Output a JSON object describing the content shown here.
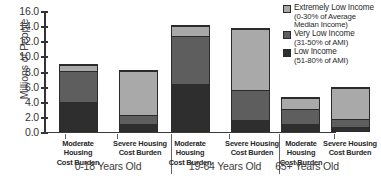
{
  "chart_data": {
    "type": "bar",
    "subtype": "stacked",
    "title": "",
    "xlabel": "",
    "ylabel": "Millions of People",
    "ylim": [
      0.0,
      16.0
    ],
    "ytick_labels": [
      "0.0",
      "2.0",
      "4.0",
      "6.0",
      "8.0",
      "10.0",
      "12.0",
      "14.0",
      "16.0"
    ],
    "ytick_values": [
      0.0,
      2.0,
      4.0,
      6.0,
      8.0,
      10.0,
      12.0,
      14.0,
      16.0
    ],
    "grid": false,
    "legend_position": "top-right",
    "categories": [
      "Moderate Housing Cost Burden",
      "Severe Housing Cost Burden",
      "Moderate Housing Cost Burden",
      "Severe Housing Cost Burden",
      "Moderate Housing Cost Burden",
      "Severe Housing Cost Burden"
    ],
    "groups": [
      {
        "label": "0-18 Years Old",
        "categories": [
          "Moderate Housing Cost Burden",
          "Severe Housing Cost Burden"
        ]
      },
      {
        "label": "19-64 Years Old",
        "categories": [
          "Moderate Housing Cost Burden",
          "Severe Housing Cost Burden"
        ]
      },
      {
        "label": "65+ Years Old",
        "categories": [
          "Moderate Housing Cost Burden",
          "Severe Housing Cost Burden"
        ]
      }
    ],
    "series": [
      {
        "name": "Low Income (51-80% of AMI)",
        "color": "#2e2e2e",
        "values": [
          4.0,
          1.0,
          6.3,
          1.5,
          1.0,
          0.6
        ]
      },
      {
        "name": "Very Low Income (31-50% of AMI)",
        "color": "#5e5e5e",
        "values": [
          4.2,
          1.2,
          6.5,
          4.0,
          2.1,
          1.0
        ]
      },
      {
        "name": "Extremely Low Income (0-30% of Average Median Income)",
        "color": "#a9a9a9",
        "values": [
          0.8,
          6.0,
          1.3,
          8.3,
          1.5,
          4.3
        ]
      }
    ],
    "totals": [
      9.0,
      8.2,
      14.1,
      13.8,
      4.6,
      5.9
    ]
  },
  "axis": {
    "y_title": "Millions of People"
  },
  "legend": {
    "items": [
      {
        "swatch": "extreme",
        "line1": "Extremely Low Income",
        "line2": "(0-30% of Average",
        "line3": "Median Income)"
      },
      {
        "swatch": "verylow",
        "line1": "Very Low Income",
        "line2": "(31-50% of AMI)",
        "line3": ""
      },
      {
        "swatch": "low",
        "line1": "Low Income",
        "line2": "(51-80% of AMI)",
        "line3": ""
      }
    ]
  },
  "category_labels": [
    {
      "line1": "Moderate Housing",
      "line2": "Cost Burden"
    },
    {
      "line1": "Severe Housing",
      "line2": "Cost Burden"
    },
    {
      "line1": "Moderate Housing",
      "line2": "Cost Burden"
    },
    {
      "line1": "Severe Housing",
      "line2": "Cost Burden"
    },
    {
      "line1": "Moderate Housing",
      "line2": "Cost Burden"
    },
    {
      "line1": "Severe Housing",
      "line2": "Cost Burden"
    }
  ],
  "group_labels": [
    "0-18 Years Old",
    "19-64 Years Old",
    "65+ Years Old"
  ]
}
